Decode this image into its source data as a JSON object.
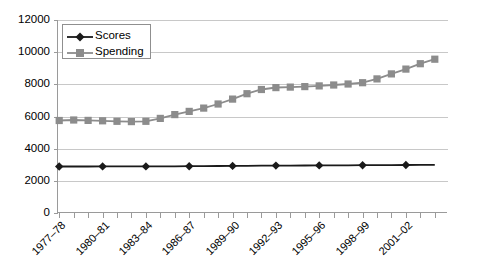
{
  "chart_data": {
    "type": "line",
    "title": "",
    "xlabel": "",
    "ylabel": "",
    "ylim": [
      0,
      12000
    ],
    "yticks": [
      0,
      2000,
      4000,
      6000,
      8000,
      10000,
      12000
    ],
    "ytick_labels": [
      "0",
      "2000",
      "4000",
      "6000",
      "8000",
      "10000",
      "12000"
    ],
    "grid": true,
    "legend_position": "top-left",
    "categories": [
      "1977–78",
      "1978–79",
      "1979–80",
      "1980–81",
      "1981–82",
      "1982–83",
      "1983–84",
      "1984–85",
      "1985–86",
      "1986–87",
      "1987–88",
      "1988–89",
      "1989–90",
      "1990–91",
      "1991–92",
      "1992–93",
      "1993–94",
      "1994–95",
      "1995–96",
      "1996–97",
      "1997–98",
      "1998–99",
      "1999–2000",
      "2000–01",
      "2001–02",
      "2002–03",
      "2003–04"
    ],
    "xtick_labels_shown": [
      "1977–78",
      "1980–81",
      "1983–84",
      "1986–87",
      "1989–90",
      "1992–93",
      "1995–96",
      "1998–99",
      "2001–02"
    ],
    "xtick_label_interval": 3,
    "series": [
      {
        "name": "Scores",
        "color": "#1a1a1a",
        "marker": "diamond",
        "marker_interval": 3,
        "values": [
          2890,
          2890,
          2890,
          2895,
          2895,
          2900,
          2900,
          2905,
          2905,
          2910,
          2915,
          2920,
          2930,
          2935,
          2940,
          2950,
          2950,
          2955,
          2960,
          2960,
          2965,
          2970,
          2975,
          2980,
          2985,
          2990,
          3000
        ]
      },
      {
        "name": "Spending",
        "color": "#8c8c8c",
        "marker": "square",
        "marker_interval": 1,
        "values": [
          5750,
          5780,
          5760,
          5730,
          5700,
          5680,
          5700,
          5880,
          6120,
          6320,
          6520,
          6780,
          7080,
          7420,
          7680,
          7800,
          7830,
          7860,
          7900,
          7960,
          8020,
          8100,
          8340,
          8650,
          8950,
          9280,
          9560
        ]
      }
    ]
  },
  "legend": {
    "items": [
      {
        "label": "Scores"
      },
      {
        "label": "Spending"
      }
    ]
  }
}
